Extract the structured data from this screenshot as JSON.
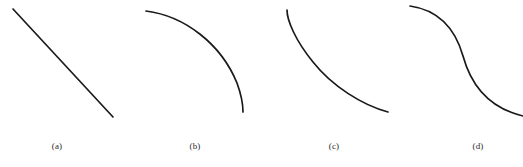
{
  "figure": {
    "width": 523,
    "height": 167,
    "background_color": "#ffffff",
    "stroke_color": "#1a1a1a",
    "stroke_width": 1.7,
    "caption_color": "#2b2b2b"
  },
  "panels": [
    {
      "key": "a",
      "caption": "(a)",
      "shape_name": "straight-decreasing-line",
      "description": "Straight line with constant negative slope",
      "path": "M 13 9 L 113 117"
    },
    {
      "key": "b",
      "caption": "(b)",
      "shape_name": "concave-down-decreasing-curve",
      "description": "Decreasing curve, flat at left, steepening to near vertical at right",
      "path": "M 146 11 C 185 16 221 44 237 83 C 241 94 243 104 243 112"
    },
    {
      "key": "c",
      "caption": "(c)",
      "shape_name": "convex-decreasing-curve",
      "description": "Decreasing curve, steep at left, flattening toward the right",
      "path": "M 287 10 C 287 20 295 40 313 62 C 332 86 362 105 388 112"
    },
    {
      "key": "d",
      "caption": "(d)",
      "shape_name": "sigmoid-decreasing-curve",
      "description": "S-shaped decreasing curve with a central inflection point",
      "path": "M 410 6 C 438 10 455 28 463 56 C 471 85 489 108 523 116"
    }
  ],
  "chart_data": {
    "type": "line",
    "title": "",
    "subtitle": "",
    "xlabel": "",
    "ylabel": "",
    "grid": false,
    "axes_shown": false,
    "legend_position": "none",
    "panel_count": 4,
    "panel_labels": [
      "(a)",
      "(b)",
      "(c)",
      "(d)"
    ],
    "note": "Four unlabeled line sketches, each monotonically decreasing left to right; no axes, ticks or numeric scales are drawn.",
    "series": [
      {
        "name": "(a) linear decrease",
        "curvature": "none",
        "x": [
          0,
          0.25,
          0.5,
          0.75,
          1
        ],
        "values": [
          1,
          0.75,
          0.5,
          0.25,
          0
        ]
      },
      {
        "name": "(b) concave-down decrease",
        "curvature": "concave down",
        "x": [
          0,
          0.25,
          0.5,
          0.75,
          1
        ],
        "values": [
          1,
          0.95,
          0.8,
          0.52,
          0
        ]
      },
      {
        "name": "(c) convex decrease",
        "curvature": "convex (concave up)",
        "x": [
          0,
          0.25,
          0.5,
          0.75,
          1
        ],
        "values": [
          1,
          0.53,
          0.25,
          0.09,
          0
        ]
      },
      {
        "name": "(d) sigmoid decrease",
        "curvature": "S-shaped, inflection at midpoint",
        "x": [
          0,
          0.25,
          0.5,
          0.75,
          1
        ],
        "values": [
          1,
          0.92,
          0.55,
          0.14,
          0.05
        ]
      }
    ],
    "xlim": [
      0,
      1
    ],
    "ylim": [
      0,
      1
    ]
  }
}
